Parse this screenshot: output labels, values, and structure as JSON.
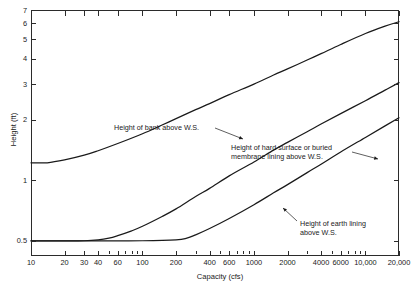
{
  "chart_data": {
    "type": "line",
    "title": "",
    "xlabel": "Capacity (cfs)",
    "ylabel": "Height (ft)",
    "xscale": "log",
    "yscale": "log",
    "xlim": [
      10,
      20000
    ],
    "ylim": [
      0.42,
      7
    ],
    "grid": false,
    "legend_position": "inline-annotations",
    "xticks": [
      {
        "value": 10,
        "label": "10"
      },
      {
        "value": 20,
        "label": "20"
      },
      {
        "value": 30,
        "label": "30"
      },
      {
        "value": 40,
        "label": "40"
      },
      {
        "value": 60,
        "label": "60"
      },
      {
        "value": 100,
        "label": "100"
      },
      {
        "value": 200,
        "label": "200"
      },
      {
        "value": 400,
        "label": "400"
      },
      {
        "value": 600,
        "label": "600"
      },
      {
        "value": 1000,
        "label": "1000"
      },
      {
        "value": 2000,
        "label": "2000"
      },
      {
        "value": 4000,
        "label": "4000"
      },
      {
        "value": 6000,
        "label": "6000"
      },
      {
        "value": 10000,
        "label": "10,000"
      },
      {
        "value": 20000,
        "label": "20,000"
      }
    ],
    "xticks_minor": [
      50,
      70,
      80,
      90,
      300,
      500,
      700,
      800,
      900,
      3000,
      5000,
      7000,
      8000,
      9000
    ],
    "yticks": [
      {
        "value": 0.5,
        "label": "0.5"
      },
      {
        "value": 1,
        "label": "1"
      },
      {
        "value": 2,
        "label": "2"
      },
      {
        "value": 3,
        "label": "3"
      },
      {
        "value": 4,
        "label": "4"
      },
      {
        "value": 5,
        "label": "5"
      },
      {
        "value": 6,
        "label": "6"
      },
      {
        "value": 7,
        "label": "7"
      }
    ],
    "series": [
      {
        "name": "Height of bank above W.S.",
        "color": "#1a1a1a",
        "points": [
          [
            10,
            1.22
          ],
          [
            14,
            1.22
          ],
          [
            20,
            1.26
          ],
          [
            30,
            1.33
          ],
          [
            40,
            1.4
          ],
          [
            60,
            1.52
          ],
          [
            100,
            1.7
          ],
          [
            150,
            1.88
          ],
          [
            200,
            2.02
          ],
          [
            300,
            2.24
          ],
          [
            400,
            2.4
          ],
          [
            600,
            2.66
          ],
          [
            1000,
            3.0
          ],
          [
            1500,
            3.33
          ],
          [
            2000,
            3.57
          ],
          [
            3000,
            3.95
          ],
          [
            4000,
            4.25
          ],
          [
            6000,
            4.72
          ],
          [
            10000,
            5.35
          ],
          [
            15000,
            5.82
          ],
          [
            20000,
            6.12
          ]
        ]
      },
      {
        "name": "Height of hard surface or buried membrane lining above W.S.",
        "color": "#1a1a1a",
        "points": [
          [
            10,
            0.5
          ],
          [
            20,
            0.5
          ],
          [
            30,
            0.5
          ],
          [
            40,
            0.505
          ],
          [
            50,
            0.515
          ],
          [
            60,
            0.53
          ],
          [
            80,
            0.56
          ],
          [
            100,
            0.59
          ],
          [
            150,
            0.66
          ],
          [
            200,
            0.72
          ],
          [
            300,
            0.83
          ],
          [
            400,
            0.91
          ],
          [
            600,
            1.05
          ],
          [
            1000,
            1.23
          ],
          [
            1500,
            1.41
          ],
          [
            2000,
            1.54
          ],
          [
            3000,
            1.74
          ],
          [
            4000,
            1.9
          ],
          [
            6000,
            2.14
          ],
          [
            10000,
            2.48
          ],
          [
            15000,
            2.8
          ],
          [
            20000,
            3.05
          ]
        ]
      },
      {
        "name": "Height of earth lining above W.S.",
        "color": "#1a1a1a",
        "points": [
          [
            10,
            0.5
          ],
          [
            40,
            0.5
          ],
          [
            100,
            0.5
          ],
          [
            200,
            0.505
          ],
          [
            250,
            0.515
          ],
          [
            300,
            0.535
          ],
          [
            400,
            0.575
          ],
          [
            600,
            0.645
          ],
          [
            1000,
            0.755
          ],
          [
            1500,
            0.865
          ],
          [
            2000,
            0.95
          ],
          [
            3000,
            1.09
          ],
          [
            4000,
            1.2
          ],
          [
            6000,
            1.38
          ],
          [
            10000,
            1.63
          ],
          [
            15000,
            1.86
          ],
          [
            20000,
            2.04
          ]
        ]
      }
    ],
    "annotations": [
      {
        "id": "bank",
        "text": "Height of bank above W.S.",
        "x_px": 114,
        "y_px": 123,
        "leader": {
          "x1": 215,
          "y1": 128,
          "x2": 243,
          "y2": 139
        }
      },
      {
        "id": "hard-surface",
        "text": "Height of hard surface or buried\nmembrane lining above W.S.",
        "x_px": 231,
        "y_px": 143,
        "leader": {
          "x1": 352,
          "y1": 152,
          "x2": 378,
          "y2": 159
        }
      },
      {
        "id": "earth-lining",
        "text": "Height of earth lining\nabove W.S.",
        "x_px": 300,
        "y_px": 219,
        "leader": {
          "x1": 297,
          "y1": 221,
          "x2": 283,
          "y2": 208
        }
      }
    ]
  }
}
